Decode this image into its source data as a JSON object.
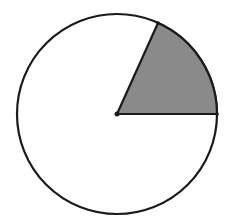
{
  "diagram": {
    "type": "circle-sector",
    "circle": {
      "cx": 117,
      "cy": 114,
      "r": 100,
      "stroke": "#1a1a1a",
      "fill": "#ffffff"
    },
    "sector": {
      "center": [
        117,
        114
      ],
      "start_point": [
        217,
        114
      ],
      "end_point": [
        158,
        23
      ],
      "angle_deg": 65,
      "fill": "#8a8a8a",
      "stroke": "#1a1a1a"
    },
    "center_dot": {
      "r": 2.5,
      "fill": "#1a1a1a"
    }
  }
}
